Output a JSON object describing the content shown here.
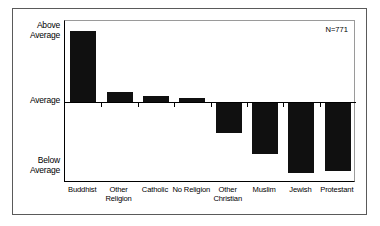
{
  "chart_data": {
    "type": "bar",
    "title": "",
    "subtitle": "",
    "xlabel": "",
    "ylabel": "",
    "orientation": "vertical",
    "grid": false,
    "legend": null,
    "legend_position": "none",
    "annotations": [
      {
        "name": "sample-size",
        "text": "N=771",
        "position": "top-right"
      }
    ],
    "categories": [
      "Buddhist",
      "Other Religion",
      "Catholic",
      "No Religion",
      "Other Christian",
      "Muslim",
      "Jewish",
      "Protestant"
    ],
    "category_lines": [
      [
        "Buddhist"
      ],
      [
        "Other",
        "Religion"
      ],
      [
        "Catholic"
      ],
      [
        "No Religion"
      ],
      [
        "Other",
        "Christian"
      ],
      [
        "Muslim"
      ],
      [
        "Jewish"
      ],
      [
        "Protestant"
      ]
    ],
    "values": [
      1.0,
      0.14,
      0.085,
      0.06,
      -0.42,
      -0.72,
      -0.99,
      -0.96
    ],
    "ytick_labels": [
      "Above Average",
      "Average",
      "Below Average"
    ],
    "ytick_values": [
      1.0,
      0.0,
      -1.0
    ],
    "ylim": [
      -1.18,
      1.12
    ],
    "bar_color": "#101010",
    "background_color": "#ffffff",
    "axis_color": "#000000"
  },
  "axes": {
    "y": {
      "above_label": "Above\nAverage",
      "average_label": "Average",
      "below_label": "Below\nAverage"
    }
  },
  "annotation": {
    "sample_size": "N=771"
  }
}
